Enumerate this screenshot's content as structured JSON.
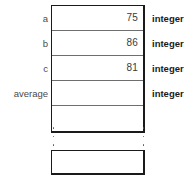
{
  "diagram": {
    "kind": "memory-cell-stack",
    "stack": {
      "rows": [
        {
          "name": "a",
          "value": "75",
          "type": "integer"
        },
        {
          "name": "b",
          "value": "86",
          "type": "integer"
        },
        {
          "name": "c",
          "value": "81",
          "type": "integer"
        },
        {
          "name": "average",
          "value": "",
          "type": "integer"
        },
        {
          "name": "",
          "value": "",
          "type": ""
        }
      ]
    },
    "ellipsis": {
      "left_icon": "vertical-ellipsis-icon",
      "right_icon": "vertical-ellipsis-icon",
      "dots": 3
    },
    "tail_cell": {
      "value": ""
    },
    "colors": {
      "outline": "#1a1a1a",
      "divider": "#6e6e6e",
      "value_text": "#3a3a3a",
      "name_text": "#4a4a4a",
      "type_text": "#1a1a1a",
      "background": "#ffffff"
    }
  }
}
